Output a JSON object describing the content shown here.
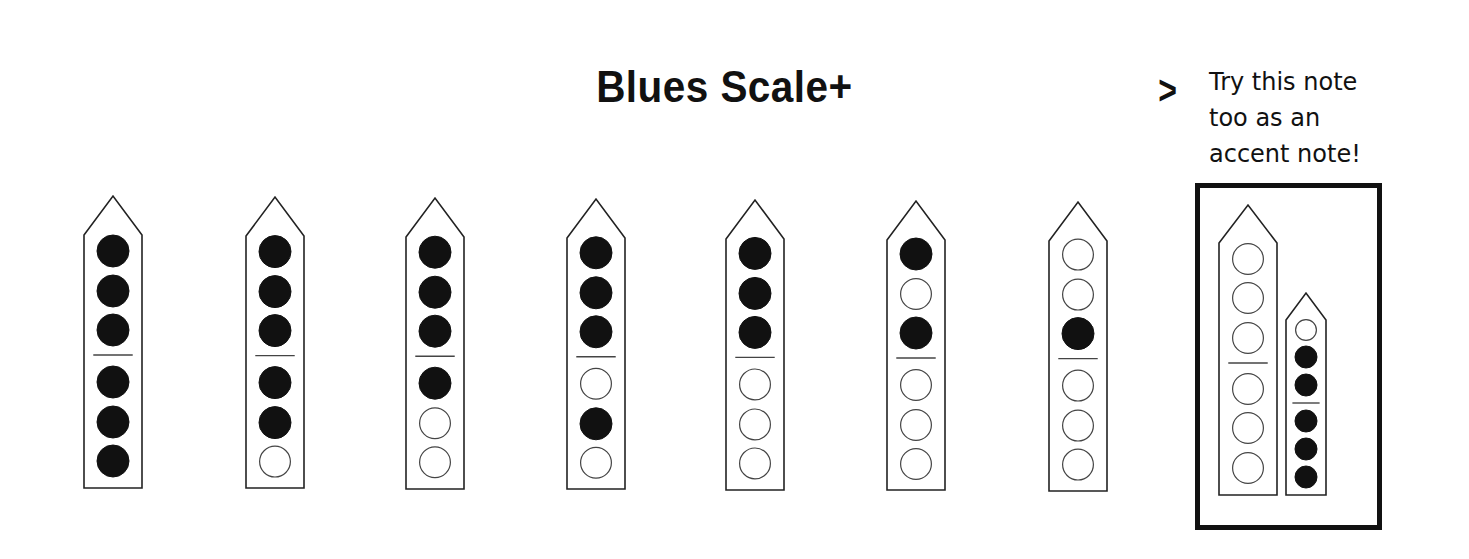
{
  "title": "Blues Scale+",
  "hint": {
    "arrow": ">",
    "lines": [
      "Try this note",
      "too as an",
      "accent note!"
    ]
  },
  "legend": {
    "filled": "covered hole",
    "open": "open hole"
  },
  "colors": {
    "ink": "#111111",
    "paper": "#ffffff"
  },
  "fingerings": [
    {
      "index": 1,
      "holes": [
        1,
        1,
        1,
        1,
        1,
        1
      ]
    },
    {
      "index": 2,
      "holes": [
        1,
        1,
        1,
        1,
        1,
        0
      ]
    },
    {
      "index": 3,
      "holes": [
        1,
        1,
        1,
        1,
        0,
        0
      ]
    },
    {
      "index": 4,
      "holes": [
        1,
        1,
        1,
        0,
        1,
        0
      ]
    },
    {
      "index": 5,
      "holes": [
        1,
        1,
        1,
        0,
        0,
        0
      ]
    },
    {
      "index": 6,
      "holes": [
        1,
        0,
        1,
        0,
        0,
        0
      ]
    },
    {
      "index": 7,
      "holes": [
        0,
        0,
        1,
        0,
        0,
        0
      ]
    }
  ],
  "accent_note": {
    "main": {
      "holes": [
        0,
        0,
        0,
        0,
        0,
        0
      ]
    },
    "small": {
      "holes": [
        0,
        1,
        1,
        1,
        1,
        1
      ]
    }
  }
}
